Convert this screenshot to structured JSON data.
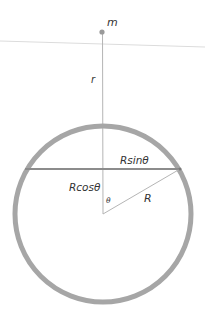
{
  "diagram": {
    "type": "spherical-shell-gravity-geometry",
    "labels": {
      "mass": "m",
      "distance": "r",
      "half_chord": "Rsinθ",
      "adjacent": "Rcosθ",
      "radius": "R",
      "angle": "θ"
    },
    "colors": {
      "shell": "#a6a6a6",
      "chord": "#8a8a8a",
      "line": "#b0b0b0",
      "point": "#9a9a9a",
      "reference_line": "#d8d8d8",
      "text": "#333333"
    },
    "geometry": {
      "center": [
        103,
        214
      ],
      "shell_radius": 88,
      "shell_stroke": 5,
      "mass_point": [
        102,
        32
      ],
      "chord_y": 169,
      "chord_x": [
        25,
        180
      ]
    }
  }
}
